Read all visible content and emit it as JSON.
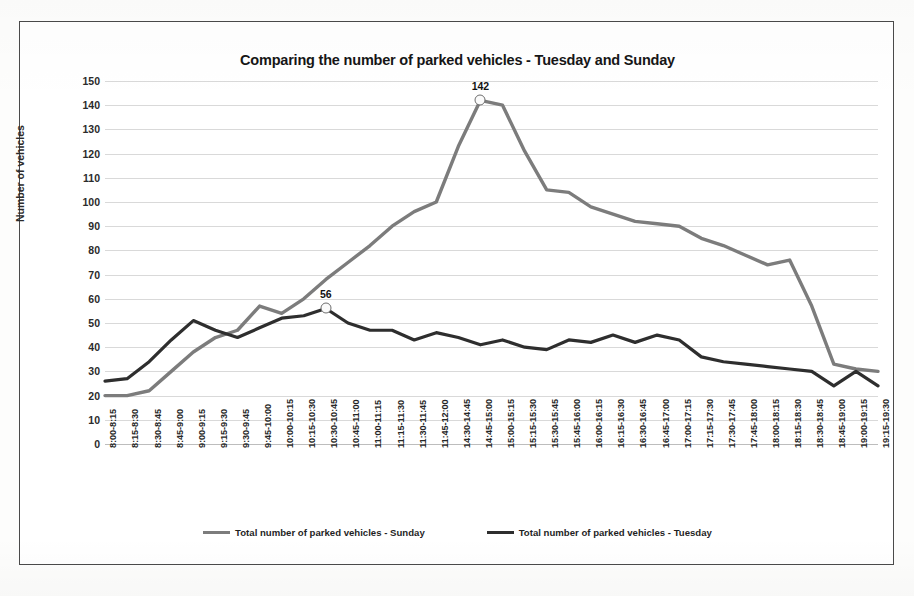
{
  "figure": {
    "title": "Comparing the number of parked vehicles - Tuesday and Sunday"
  },
  "axes": {
    "y_title": "Number of vehicles",
    "y_ticks": [
      "0",
      "10",
      "20",
      "30",
      "40",
      "50",
      "60",
      "70",
      "80",
      "90",
      "100",
      "110",
      "120",
      "130",
      "140",
      "150"
    ]
  },
  "legend": {
    "items": [
      {
        "label": "Total number of parked vehicles - Sunday",
        "color": "#7c7c7c"
      },
      {
        "label": "Total number of parked vehicles - Tuesday",
        "color": "#2e2e2e"
      }
    ]
  },
  "annotations": [
    {
      "text": "142",
      "series": "Sunday",
      "category": "14:45-15:00",
      "value": 142
    },
    {
      "text": "56",
      "series": "Tuesday",
      "category": "10:30-10:45",
      "value": 56
    }
  ],
  "chart_data": {
    "type": "line",
    "title": "Comparing the number of parked vehicles - Tuesday and Sunday",
    "xlabel": "",
    "ylabel": "Number of vehicles",
    "ylim": [
      0,
      150
    ],
    "ytick_step": 10,
    "grid": true,
    "legend_position": "bottom",
    "categories": [
      "8:00-8:15",
      "8:15-8:30",
      "8:30-8:45",
      "8:45-9:00",
      "9:00-9:15",
      "9:15-9:30",
      "9:30-9:45",
      "9:45-10:00",
      "10:00-10:15",
      "10:15-10:30",
      "10:30-10:45",
      "10:45-11:00",
      "11:00-11:15",
      "11:15-11:30",
      "11:30-11:45",
      "11:45-12:00",
      "14:30-14:45",
      "14:45-15:00",
      "15:00-15:15",
      "15:15-15:30",
      "15:30-15:45",
      "15:45-16:00",
      "16:00-16:15",
      "16:15-16:30",
      "16:30-16:45",
      "16:45-17:00",
      "17:00-17:15",
      "17:15-17:30",
      "17:30-17:45",
      "17:45-18:00",
      "18:00-18:15",
      "18:15-18:30",
      "18:30-18:45",
      "18:45-19:00",
      "19:00-19:15",
      "19:15-19:30"
    ],
    "series": [
      {
        "name": "Total number of parked vehicles - Sunday",
        "color": "#7c7c7c",
        "values": [
          20,
          20,
          22,
          30,
          38,
          44,
          47,
          57,
          54,
          60,
          68,
          75,
          82,
          90,
          96,
          100,
          123,
          142,
          140,
          121,
          105,
          104,
          98,
          95,
          92,
          91,
          90,
          85,
          82,
          78,
          74,
          76,
          57,
          33,
          31,
          30
        ]
      },
      {
        "name": "Total number of parked vehicles - Tuesday",
        "color": "#2e2e2e",
        "values": [
          26,
          27,
          34,
          43,
          51,
          47,
          44,
          48,
          52,
          53,
          56,
          50,
          47,
          47,
          43,
          46,
          44,
          41,
          43,
          40,
          39,
          43,
          42,
          45,
          42,
          45,
          43,
          36,
          34,
          33,
          32,
          31,
          30,
          24,
          30,
          24
        ]
      }
    ]
  }
}
